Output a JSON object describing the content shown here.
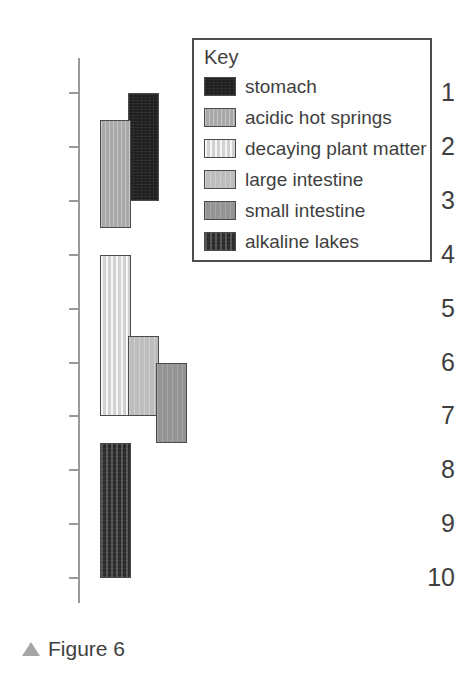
{
  "chart_data": {
    "type": "bar",
    "orientation": "vertical-range",
    "title": "",
    "xlabel": "",
    "ylabel": "",
    "ylim": [
      1,
      10
    ],
    "y_inverted": true,
    "grid": false,
    "legend_position": "top-right",
    "tick_labels": [
      "1",
      "2",
      "3",
      "4",
      "5",
      "6",
      "7",
      "8",
      "9",
      "10"
    ],
    "tick_values": [
      1,
      2,
      3,
      4,
      5,
      6,
      7,
      8,
      9,
      10
    ],
    "series": [
      {
        "name": "stomach",
        "start": 1,
        "end": 3,
        "color": "#201f1f",
        "column": 1
      },
      {
        "name": "acidic hot springs",
        "start": 1.5,
        "end": 3.5,
        "color": "#a8a8a8",
        "column": 0
      },
      {
        "name": "decaying plant matter",
        "start": 4,
        "end": 7,
        "color": "#dcdcdc",
        "column": 0
      },
      {
        "name": "large intestine",
        "start": 5.5,
        "end": 7,
        "color": "#bdbdbd",
        "column": 1
      },
      {
        "name": "small intestine",
        "start": 6,
        "end": 7.5,
        "color": "#949494",
        "column": 2
      },
      {
        "name": "alkaline lakes",
        "start": 7.5,
        "end": 10,
        "color": "#343434",
        "column": 0
      }
    ]
  },
  "legend": {
    "title": "Key",
    "items": [
      {
        "label": "stomach",
        "swatch": "stomach-swatch"
      },
      {
        "label": "acidic hot springs",
        "swatch": "acidic-hot-springs-swatch"
      },
      {
        "label": "decaying plant matter",
        "swatch": "decaying-plant-matter-swatch"
      },
      {
        "label": "large intestine",
        "swatch": "large-intestine-swatch"
      },
      {
        "label": "small intestine",
        "swatch": "small-intestine-swatch"
      },
      {
        "label": "alkaline lakes",
        "swatch": "alkaline-lakes-swatch"
      }
    ]
  },
  "caption": {
    "marker": "triangle-up-icon",
    "text": "Figure 6"
  },
  "colors": {
    "axis": "#9a9a9a",
    "text": "#3f3f3f",
    "bar_outline": "#4a4a4a",
    "legend_border": "#4d4d4d",
    "caption_marker": "#a6a6a6",
    "background": "#ffffff"
  }
}
